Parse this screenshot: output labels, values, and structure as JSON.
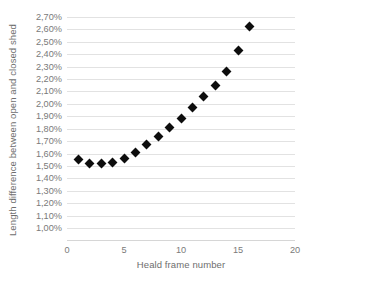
{
  "chart_data": {
    "type": "scatter",
    "title": "",
    "xlabel": "Heald frame number",
    "ylabel": "Length difference between open and closed shed",
    "xlim": [
      0,
      20
    ],
    "ylim": [
      1.0,
      2.7
    ],
    "grid": true,
    "legend": null,
    "marker": "diamond",
    "marker_color": "#0d0d0d",
    "value_suffix": "%",
    "decimal_separator": ",",
    "x": [
      1,
      2,
      3,
      4,
      5,
      6,
      7,
      8,
      9,
      10,
      11,
      12,
      13,
      14,
      15,
      16
    ],
    "values": [
      1.55,
      1.52,
      1.52,
      1.53,
      1.56,
      1.61,
      1.67,
      1.74,
      1.81,
      1.88,
      1.97,
      2.06,
      2.15,
      2.26,
      2.43,
      2.62
    ],
    "x_ticks": [
      "0",
      "5",
      "10",
      "15",
      "20"
    ],
    "x_tick_values": [
      0,
      5,
      10,
      15,
      20
    ],
    "y_ticks": [
      "2,70%",
      "2,60%",
      "2,50%",
      "2,40%",
      "2,30%",
      "2,20%",
      "2,10%",
      "2,00%",
      "1,90%",
      "1,80%",
      "1,70%",
      "1,60%",
      "1,50%",
      "1,40%",
      "1,30%",
      "1,20%",
      "1,10%",
      "1,00%"
    ],
    "y_tick_values": [
      2.7,
      2.6,
      2.5,
      2.4,
      2.3,
      2.2,
      2.1,
      2.0,
      1.9,
      1.8,
      1.7,
      1.6,
      1.5,
      1.4,
      1.3,
      1.2,
      1.1,
      1.0
    ]
  }
}
